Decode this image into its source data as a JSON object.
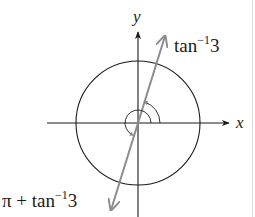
{
  "figure": {
    "axes": {
      "x_label": "x",
      "y_label": "y"
    },
    "circle": {
      "label": "unit circle"
    },
    "line": {
      "color": "#8c8c8c"
    },
    "angles": {
      "first": {
        "base": "tan",
        "superscript": "−1",
        "argument": "3"
      },
      "second": {
        "prefix": "π + ",
        "base": "tan",
        "superscript": "−1",
        "argument": "3"
      }
    },
    "colors": {
      "ink": "#1a1a1a",
      "line_gray": "#8c8c8c",
      "background": "#ffffff"
    }
  }
}
